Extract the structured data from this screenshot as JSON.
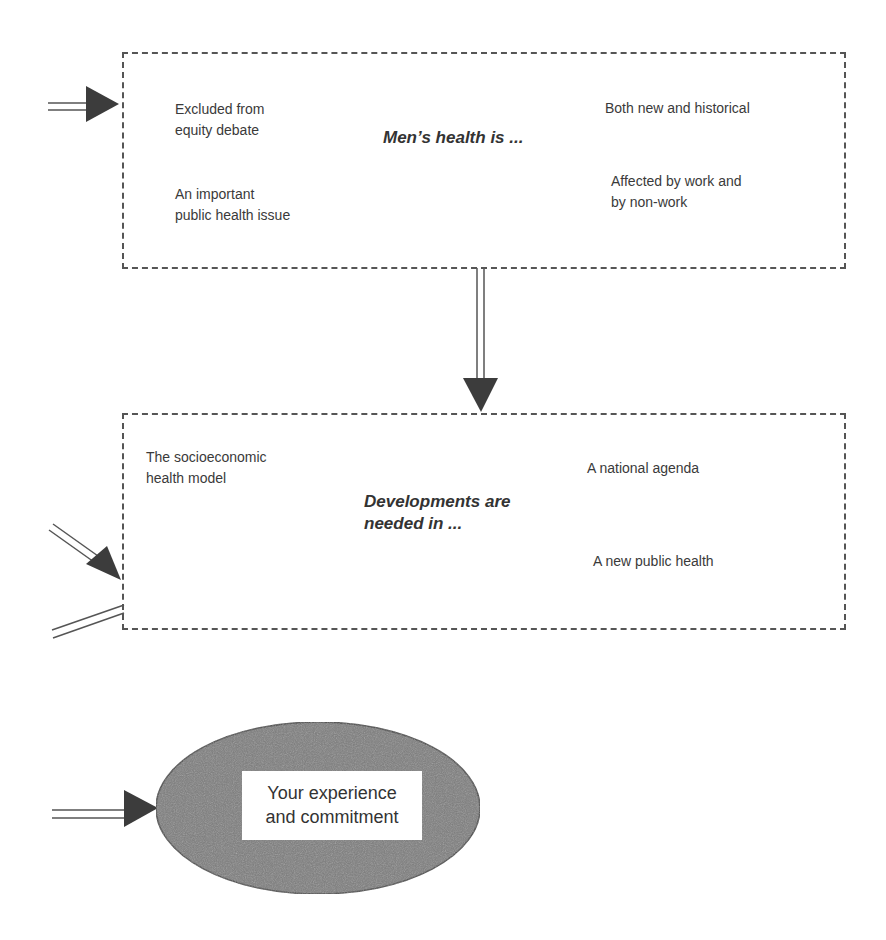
{
  "diagram": {
    "box1": {
      "title": "Men’s health is ...",
      "items": [
        "Excluded from\nequity debate",
        "An important\npublic health issue",
        "Both new and historical",
        "Affected by work and\nby non-work"
      ]
    },
    "box2": {
      "title": "Developments are\nneeded in ...",
      "items": [
        "The socioeconomic\nhealth model",
        "A national agenda",
        "A new public health"
      ]
    },
    "oval": {
      "label": "Your experience\nand commitment"
    },
    "colors": {
      "border": "#555555",
      "arrow": "#3c3c3c",
      "oval_fill": "#7a7a7a",
      "text": "#3a3a3a"
    }
  }
}
